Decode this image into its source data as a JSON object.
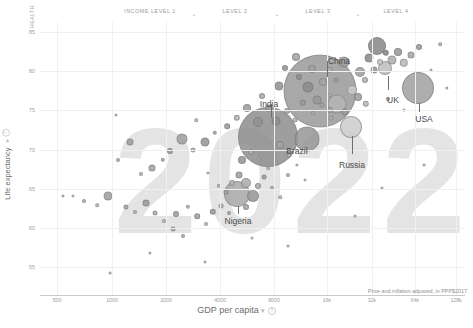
{
  "header": {
    "health_tag": "HEALTH",
    "income_levels": [
      {
        "label": "INCOME LEVEL 1",
        "x": 150
      },
      {
        "label": "LEVEL 2",
        "x": 235
      },
      {
        "label": "LEVEL 3",
        "x": 318
      },
      {
        "label": "LEVEL 4",
        "x": 396
      }
    ],
    "separators": [
      {
        "glyph": "•",
        "x": 193
      },
      {
        "glyph": "•",
        "x": 276
      },
      {
        "glyph": "•",
        "x": 357
      }
    ]
  },
  "watermark": "2022",
  "axes": {
    "x_title": "GDP per capita",
    "x_control": "▾",
    "y_title": "Life expectancy",
    "y_control": "▾",
    "info_glyph": "?",
    "note": "Price and inflation adjusted, in PPP$2017",
    "x_ticks": [
      "500",
      "1000",
      "2000",
      "4000",
      "8000",
      "16k",
      "32k",
      "64k",
      "128k"
    ],
    "y_ticks": [
      "85",
      "80",
      "75",
      "70",
      "65",
      "60",
      "55"
    ]
  },
  "chart_data": {
    "type": "scatter",
    "title": "2022",
    "xlabel": "GDP per capita",
    "ylabel": "Life expectancy",
    "xscale": "log",
    "xlim": [
      380,
      170000
    ],
    "ylim": [
      52,
      88
    ],
    "grid": true,
    "legend": "none",
    "note": "Price and inflation adjusted, in PPP$2017",
    "income_level_boundaries": [
      2000,
      8000,
      32000
    ],
    "annotations": [
      "China",
      "India",
      "Brazil",
      "Russia",
      "Nigeria",
      "UK",
      "USA"
    ],
    "bubble_encoding": "radius = population",
    "points": [
      {
        "name": "China",
        "x": 17500,
        "y": 78.6,
        "r": 36
      },
      {
        "name": "India",
        "x": 7300,
        "y": 70.9,
        "r": 31
      },
      {
        "name": "USA",
        "x": 64000,
        "y": 79.0,
        "r": 16
      },
      {
        "name": "Brazil",
        "x": 14500,
        "y": 75.9,
        "r": 12
      },
      {
        "name": "Russia",
        "x": 27000,
        "y": 73.0,
        "r": 11
      },
      {
        "name": "Nigeria",
        "x": 5000,
        "y": 63.0,
        "r": 13
      },
      {
        "name": "UK",
        "x": 45000,
        "y": 81.4,
        "r": 7
      }
    ],
    "series": [
      {
        "name": "countries",
        "n_points": 190
      }
    ]
  },
  "bubbles": [
    {
      "cx": 320,
      "cy": 91,
      "r": 36.5,
      "fill": "#9a9a9a",
      "op": 0.85
    },
    {
      "cx": 268,
      "cy": 137,
      "r": 30.0,
      "fill": "#8e8e8e",
      "op": 0.85
    },
    {
      "cx": 418,
      "cy": 88,
      "r": 16.0,
      "fill": "#a6a6a6",
      "op": 0.9
    },
    {
      "cx": 307,
      "cy": 139,
      "r": 12.5,
      "fill": "#969696",
      "op": 0.85
    },
    {
      "cx": 351,
      "cy": 127,
      "r": 11.0,
      "fill": "#cfcfcf",
      "op": 0.9
    },
    {
      "cx": 237,
      "cy": 194,
      "r": 13.0,
      "fill": "#a8a8a8",
      "op": 0.85
    },
    {
      "cx": 385,
      "cy": 68,
      "r": 7.0,
      "fill": "#c2c2c2",
      "op": 0.9
    },
    {
      "cx": 377,
      "cy": 46,
      "r": 9.0,
      "fill": "#8d8d8d",
      "op": 0.9
    },
    {
      "cx": 337,
      "cy": 104,
      "r": 9.5,
      "fill": "#b6b6b6",
      "op": 0.85
    },
    {
      "cx": 344,
      "cy": 62,
      "r": 5.5,
      "fill": "#9e9e9e",
      "op": 0.9
    },
    {
      "cx": 360,
      "cy": 72,
      "r": 5.0,
      "fill": "#a3a3a3",
      "op": 0.9
    },
    {
      "cx": 369,
      "cy": 58,
      "r": 4.5,
      "fill": "#8f8f8f",
      "op": 0.9
    },
    {
      "cx": 392,
      "cy": 60,
      "r": 4.5,
      "fill": "#b0b0b0",
      "op": 0.9
    },
    {
      "cx": 398,
      "cy": 52,
      "r": 4.0,
      "fill": "#9c9c9c",
      "op": 0.9
    },
    {
      "cx": 404,
      "cy": 63,
      "r": 4.2,
      "fill": "#bdbdbd",
      "op": 0.9
    },
    {
      "cx": 411,
      "cy": 55,
      "r": 3.5,
      "fill": "#a9a9a9",
      "op": 0.9
    },
    {
      "cx": 386,
      "cy": 53,
      "r": 3.2,
      "fill": "#8a8a8a",
      "op": 0.9
    },
    {
      "cx": 380,
      "cy": 62,
      "r": 3.0,
      "fill": "#c7c7c7",
      "op": 0.9
    },
    {
      "cx": 374,
      "cy": 70,
      "r": 3.5,
      "fill": "#9a9a9a",
      "op": 0.9
    },
    {
      "cx": 365,
      "cy": 80,
      "r": 3.0,
      "fill": "#b4b4b4",
      "op": 0.9
    },
    {
      "cx": 352,
      "cy": 90,
      "r": 5.0,
      "fill": "#c9c9c9",
      "op": 0.9
    },
    {
      "cx": 358,
      "cy": 97,
      "r": 4.0,
      "fill": "#a0a0a0",
      "op": 0.9
    },
    {
      "cx": 366,
      "cy": 104,
      "r": 3.2,
      "fill": "#bbbbbb",
      "op": 0.9
    },
    {
      "cx": 345,
      "cy": 112,
      "r": 3.5,
      "fill": "#9d9d9d",
      "op": 0.9
    },
    {
      "cx": 331,
      "cy": 118,
      "r": 2.5,
      "fill": "#b3b3b3",
      "op": 0.9
    },
    {
      "cx": 419,
      "cy": 47,
      "r": 3.0,
      "fill": "#9f9f9f",
      "op": 0.9
    },
    {
      "cx": 440,
      "cy": 44,
      "r": 1.8,
      "fill": "#b8b8b8",
      "op": 0.9
    },
    {
      "cx": 431,
      "cy": 70,
      "r": 1.5,
      "fill": "#c0c0c0",
      "op": 0.9
    },
    {
      "cx": 447,
      "cy": 88,
      "r": 1.6,
      "fill": "#bcbcbc",
      "op": 0.9
    },
    {
      "cx": 404,
      "cy": 110,
      "r": 1.5,
      "fill": "#c4c4c4",
      "op": 0.9
    },
    {
      "cx": 388,
      "cy": 99,
      "r": 2.0,
      "fill": "#b2b2b2",
      "op": 0.9
    },
    {
      "cx": 296,
      "cy": 57,
      "r": 4.0,
      "fill": "#a5a5a5",
      "op": 0.9
    },
    {
      "cx": 285,
      "cy": 68,
      "r": 3.0,
      "fill": "#9b9b9b",
      "op": 0.9
    },
    {
      "cx": 279,
      "cy": 86,
      "r": 4.5,
      "fill": "#969696",
      "op": 0.9
    },
    {
      "cx": 262,
      "cy": 96,
      "r": 3.0,
      "fill": "#acacac",
      "op": 0.9
    },
    {
      "cx": 247,
      "cy": 108,
      "r": 4.0,
      "fill": "#a1a1a1",
      "op": 0.9
    },
    {
      "cx": 237,
      "cy": 118,
      "r": 3.2,
      "fill": "#b6b6b6",
      "op": 0.9
    },
    {
      "cx": 227,
      "cy": 126,
      "r": 2.8,
      "fill": "#9e9e9e",
      "op": 0.9
    },
    {
      "cx": 215,
      "cy": 133,
      "r": 2.2,
      "fill": "#aaaaaa",
      "op": 0.9
    },
    {
      "cx": 205,
      "cy": 142,
      "r": 4.5,
      "fill": "#9a9a9a",
      "op": 0.9
    },
    {
      "cx": 193,
      "cy": 150,
      "r": 2.5,
      "fill": "#b5b5b5",
      "op": 0.9
    },
    {
      "cx": 182,
      "cy": 139,
      "r": 5.5,
      "fill": "#a4a4a4",
      "op": 0.9
    },
    {
      "cx": 170,
      "cy": 151,
      "r": 3.0,
      "fill": "#9c9c9c",
      "op": 0.9
    },
    {
      "cx": 163,
      "cy": 160,
      "r": 2.2,
      "fill": "#b1b1b1",
      "op": 0.9
    },
    {
      "cx": 152,
      "cy": 168,
      "r": 3.5,
      "fill": "#a7a7a7",
      "op": 0.9
    },
    {
      "cx": 141,
      "cy": 174,
      "r": 2.0,
      "fill": "#bababa",
      "op": 0.9
    },
    {
      "cx": 130,
      "cy": 142,
      "r": 3.5,
      "fill": "#9f9f9f",
      "op": 0.9
    },
    {
      "cx": 118,
      "cy": 160,
      "r": 2.0,
      "fill": "#b4b4b4",
      "op": 0.9
    },
    {
      "cx": 108,
      "cy": 196,
      "r": 4.5,
      "fill": "#a3a3a3",
      "op": 0.9
    },
    {
      "cx": 97,
      "cy": 205,
      "r": 1.8,
      "fill": "#bcbcbc",
      "op": 0.9
    },
    {
      "cx": 84,
      "cy": 201,
      "r": 2.0,
      "fill": "#b0b0b0",
      "op": 0.9
    },
    {
      "cx": 73,
      "cy": 196,
      "r": 1.5,
      "fill": "#c0c0c0",
      "op": 0.9
    },
    {
      "cx": 63,
      "cy": 196,
      "r": 1.6,
      "fill": "#bebebe",
      "op": 0.9
    },
    {
      "cx": 126,
      "cy": 207,
      "r": 2.6,
      "fill": "#a9a9a9",
      "op": 0.9
    },
    {
      "cx": 135,
      "cy": 212,
      "r": 2.0,
      "fill": "#b7b7b7",
      "op": 0.9
    },
    {
      "cx": 146,
      "cy": 203,
      "r": 3.5,
      "fill": "#9d9d9d",
      "op": 0.9
    },
    {
      "cx": 155,
      "cy": 213,
      "r": 2.5,
      "fill": "#aeaeae",
      "op": 0.9
    },
    {
      "cx": 164,
      "cy": 221,
      "r": 2.0,
      "fill": "#b9b9b9",
      "op": 0.9
    },
    {
      "cx": 173,
      "cy": 229,
      "r": 2.4,
      "fill": "#a6a6a6",
      "op": 0.9
    },
    {
      "cx": 183,
      "cy": 236,
      "r": 2.0,
      "fill": "#b2b2b2",
      "op": 0.9
    },
    {
      "cx": 176,
      "cy": 214,
      "r": 3.0,
      "fill": "#a0a0a0",
      "op": 0.9
    },
    {
      "cx": 188,
      "cy": 207,
      "r": 2.2,
      "fill": "#b8b8b8",
      "op": 0.9
    },
    {
      "cx": 197,
      "cy": 216,
      "r": 2.8,
      "fill": "#a4a4a4",
      "op": 0.9
    },
    {
      "cx": 206,
      "cy": 224,
      "r": 2.0,
      "fill": "#bdbdbd",
      "op": 0.9
    },
    {
      "cx": 213,
      "cy": 212,
      "r": 3.2,
      "fill": "#9e9e9e",
      "op": 0.9
    },
    {
      "cx": 221,
      "cy": 206,
      "r": 2.4,
      "fill": "#b4b4b4",
      "op": 0.9
    },
    {
      "cx": 229,
      "cy": 213,
      "r": 2.0,
      "fill": "#ababab",
      "op": 0.9
    },
    {
      "cx": 246,
      "cy": 207,
      "r": 3.0,
      "fill": "#a8a8a8",
      "op": 0.9
    },
    {
      "cx": 253,
      "cy": 196,
      "r": 6.0,
      "fill": "#9b9b9b",
      "op": 0.9
    },
    {
      "cx": 246,
      "cy": 183,
      "r": 5.0,
      "fill": "#b0b0b0",
      "op": 0.9
    },
    {
      "cx": 239,
      "cy": 175,
      "r": 3.5,
      "fill": "#a2a2a2",
      "op": 0.9
    },
    {
      "cx": 232,
      "cy": 183,
      "r": 3.0,
      "fill": "#b6b6b6",
      "op": 0.9
    },
    {
      "cx": 226,
      "cy": 192,
      "r": 2.6,
      "fill": "#a5a5a5",
      "op": 0.9
    },
    {
      "cx": 219,
      "cy": 186,
      "r": 2.2,
      "fill": "#bababa",
      "op": 0.9
    },
    {
      "cx": 258,
      "cy": 186,
      "r": 3.0,
      "fill": "#adadad",
      "op": 0.9
    },
    {
      "cx": 264,
      "cy": 177,
      "r": 2.4,
      "fill": "#9f9f9f",
      "op": 0.9
    },
    {
      "cx": 272,
      "cy": 188,
      "r": 2.0,
      "fill": "#b3b3b3",
      "op": 0.9
    },
    {
      "cx": 280,
      "cy": 197,
      "r": 1.8,
      "fill": "#c0c0c0",
      "op": 0.9
    },
    {
      "cx": 288,
      "cy": 175,
      "r": 2.0,
      "fill": "#b7b7b7",
      "op": 0.9
    },
    {
      "cx": 297,
      "cy": 165,
      "r": 1.6,
      "fill": "#c3c3c3",
      "op": 0.9
    },
    {
      "cx": 305,
      "cy": 180,
      "r": 1.5,
      "fill": "#c6c6c6",
      "op": 0.9
    },
    {
      "cx": 242,
      "cy": 160,
      "r": 4.0,
      "fill": "#999999",
      "op": 0.9
    },
    {
      "cx": 251,
      "cy": 152,
      "r": 3.0,
      "fill": "#aeaeae",
      "op": 0.9
    },
    {
      "cx": 259,
      "cy": 160,
      "r": 2.2,
      "fill": "#b9b9b9",
      "op": 0.9
    },
    {
      "cx": 268,
      "cy": 168,
      "r": 1.8,
      "fill": "#c1c1c1",
      "op": 0.9
    },
    {
      "cx": 276,
      "cy": 121,
      "r": 4.5,
      "fill": "#8f8f8f",
      "op": 0.9
    },
    {
      "cx": 287,
      "cy": 111,
      "r": 3.0,
      "fill": "#a8a8a8",
      "op": 0.9
    },
    {
      "cx": 295,
      "cy": 120,
      "r": 2.4,
      "fill": "#b5b5b5",
      "op": 0.9
    },
    {
      "cx": 303,
      "cy": 103,
      "r": 3.2,
      "fill": "#9c9c9c",
      "op": 0.9
    },
    {
      "cx": 313,
      "cy": 113,
      "r": 2.0,
      "fill": "#b1b1b1",
      "op": 0.9
    },
    {
      "cx": 322,
      "cy": 105,
      "r": 2.6,
      "fill": "#a7a7a7",
      "op": 0.9
    },
    {
      "cx": 330,
      "cy": 95,
      "r": 2.0,
      "fill": "#bbbbbb",
      "op": 0.9
    },
    {
      "cx": 312,
      "cy": 69,
      "r": 4.0,
      "fill": "#a1a1a1",
      "op": 0.85
    },
    {
      "cx": 299,
      "cy": 77,
      "r": 3.0,
      "fill": "#8e8e8e",
      "op": 0.85
    },
    {
      "cx": 330,
      "cy": 70,
      "r": 3.2,
      "fill": "#b0b0b0",
      "op": 0.85
    },
    {
      "cx": 336,
      "cy": 80,
      "r": 2.5,
      "fill": "#9a9a9a",
      "op": 0.85
    },
    {
      "cx": 308,
      "cy": 87,
      "r": 5.5,
      "fill": "#8b8b8b",
      "op": 0.85
    },
    {
      "cx": 323,
      "cy": 82,
      "r": 4.0,
      "fill": "#a4a4a4",
      "op": 0.85
    },
    {
      "cx": 317,
      "cy": 100,
      "r": 4.5,
      "fill": "#979797",
      "op": 0.85
    },
    {
      "cx": 330,
      "cy": 110,
      "r": 3.0,
      "fill": "#a9a9a9",
      "op": 0.85
    },
    {
      "cx": 269,
      "cy": 108,
      "r": 3.5,
      "fill": "#9e9e9e",
      "op": 0.85
    },
    {
      "cx": 258,
      "cy": 122,
      "r": 5.0,
      "fill": "#929292",
      "op": 0.85
    },
    {
      "cx": 280,
      "cy": 145,
      "r": 4.0,
      "fill": "#a3a3a3",
      "op": 0.85
    },
    {
      "cx": 289,
      "cy": 155,
      "r": 2.5,
      "fill": "#b2b2b2",
      "op": 0.85
    },
    {
      "cx": 150,
      "cy": 253,
      "r": 1.6,
      "fill": "#c2c2c2",
      "op": 0.9
    },
    {
      "cx": 205,
      "cy": 262,
      "r": 1.5,
      "fill": "#c5c5c5",
      "op": 0.9
    },
    {
      "cx": 252,
      "cy": 238,
      "r": 1.5,
      "fill": "#c6c6c6",
      "op": 0.9
    },
    {
      "cx": 288,
      "cy": 246,
      "r": 1.4,
      "fill": "#c8c8c8",
      "op": 0.9
    },
    {
      "cx": 110,
      "cy": 273,
      "r": 1.4,
      "fill": "#c9c9c9",
      "op": 0.9
    },
    {
      "cx": 355,
      "cy": 216,
      "r": 1.4,
      "fill": "#c8c8c8",
      "op": 0.9
    },
    {
      "cx": 382,
      "cy": 188,
      "r": 1.5,
      "fill": "#c4c4c4",
      "op": 0.9
    },
    {
      "cx": 424,
      "cy": 165,
      "r": 1.4,
      "fill": "#c7c7c7",
      "op": 0.9
    },
    {
      "cx": 208,
      "cy": 173,
      "r": 1.6,
      "fill": "#c0c0c0",
      "op": 0.9
    },
    {
      "cx": 196,
      "cy": 120,
      "r": 1.8,
      "fill": "#bfbfbf",
      "op": 0.9
    },
    {
      "cx": 116,
      "cy": 115,
      "r": 1.6,
      "fill": "#c2c2c2",
      "op": 0.9
    }
  ],
  "callouts": [
    {
      "name": "China",
      "lx": 339,
      "ly": 56,
      "leader_x": 327,
      "leader_y": 61,
      "leader_h": 16
    },
    {
      "name": "India",
      "lx": 269,
      "ly": 99,
      "leader_x": 271,
      "leader_y": 104,
      "leader_h": 14
    },
    {
      "name": "Brazil",
      "lx": 297,
      "ly": 146,
      "leader_x": 307,
      "leader_y": 146,
      "leader_h": 0
    },
    {
      "name": "Russia",
      "lx": 352,
      "ly": 160,
      "leader_x": 352,
      "leader_y": 136,
      "leader_h": 18
    },
    {
      "name": "Nigeria",
      "lx": 238,
      "ly": 216,
      "leader_x": 238,
      "leader_y": 206,
      "leader_h": 8
    },
    {
      "name": "UK",
      "lx": 393,
      "ly": 95,
      "leader_x": 388,
      "leader_y": 76,
      "leader_h": 14
    },
    {
      "name": "USA",
      "lx": 424,
      "ly": 114,
      "leader_x": 419,
      "leader_y": 103,
      "leader_h": 9
    }
  ]
}
